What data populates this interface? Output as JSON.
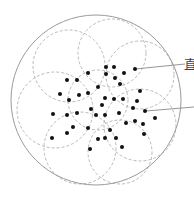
{
  "diagram": {
    "width": 194,
    "height": 197,
    "colors": {
      "background": "#ffffff",
      "outer_circle": "#9a9a9a",
      "dashed_circle": "#a8a8a8",
      "dot": "#111111",
      "leader_line": "#8a8a8a",
      "label": "#444444"
    },
    "outer_circle": {
      "cx": 96,
      "cy": 100,
      "r": 85
    },
    "dashed_circles": [
      {
        "cx": 112,
        "cy": 53,
        "r": 34
      },
      {
        "cx": 69,
        "cy": 66,
        "r": 36
      },
      {
        "cx": 140,
        "cy": 75,
        "r": 34
      },
      {
        "cx": 55,
        "cy": 110,
        "r": 38
      },
      {
        "cx": 140,
        "cy": 125,
        "r": 36
      },
      {
        "cx": 80,
        "cy": 148,
        "r": 36
      },
      {
        "cx": 120,
        "cy": 152,
        "r": 32
      },
      {
        "cx": 98,
        "cy": 100,
        "r": 30
      }
    ],
    "dots": [
      [
        106,
        67
      ],
      [
        114,
        67
      ],
      [
        135,
        69
      ],
      [
        88,
        73
      ],
      [
        106,
        74
      ],
      [
        124,
        73
      ],
      [
        115,
        78
      ],
      [
        67,
        80
      ],
      [
        77,
        80
      ],
      [
        120,
        84
      ],
      [
        98,
        87
      ],
      [
        140,
        91
      ],
      [
        60,
        94
      ],
      [
        79,
        95
      ],
      [
        88,
        93
      ],
      [
        105,
        98
      ],
      [
        114,
        99
      ],
      [
        123,
        99
      ],
      [
        69,
        100
      ],
      [
        137,
        101
      ],
      [
        102,
        105
      ],
      [
        133,
        108
      ],
      [
        91,
        109
      ],
      [
        145,
        111
      ],
      [
        53,
        114
      ],
      [
        67,
        115
      ],
      [
        77,
        113
      ],
      [
        96,
        115
      ],
      [
        105,
        115
      ],
      [
        119,
        113
      ],
      [
        155,
        118
      ],
      [
        126,
        123
      ],
      [
        135,
        121
      ],
      [
        143,
        124
      ],
      [
        73,
        127
      ],
      [
        88,
        128
      ],
      [
        110,
        130
      ],
      [
        67,
        133
      ],
      [
        144,
        134
      ],
      [
        52,
        138
      ],
      [
        98,
        139
      ],
      [
        105,
        138
      ],
      [
        116,
        138
      ],
      [
        122,
        147
      ],
      [
        90,
        149
      ]
    ],
    "dot_radius": 2,
    "leaders": [
      {
        "x1": 135,
        "y1": 69,
        "x2": 185,
        "y2": 64
      },
      {
        "x1": 146,
        "y1": 111,
        "x2": 194,
        "y2": 107
      }
    ],
    "labels": [
      {
        "text": "直",
        "x": 184,
        "y": 58
      }
    ]
  }
}
